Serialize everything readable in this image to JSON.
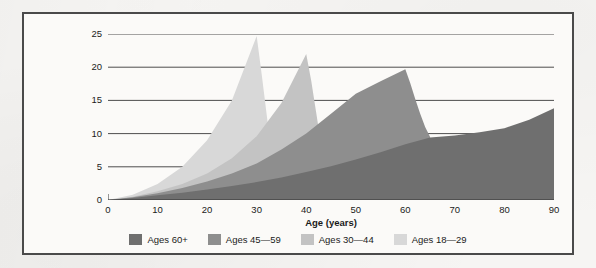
{
  "figure": {
    "frame_color": "#4a4a4a",
    "background_color": "#fbfaf8"
  },
  "chart_data": {
    "type": "area",
    "title": "",
    "subtitle": "",
    "xlabel": "Age (years)",
    "ylabel": "Lifetime prevalence of depression (%)",
    "ylabel_lines": [
      "Lifetime prevalence of",
      "depression (%)"
    ],
    "xlim": [
      0,
      90
    ],
    "ylim": [
      0,
      25
    ],
    "xticks": [
      0,
      10,
      20,
      30,
      40,
      50,
      60,
      70,
      80,
      90
    ],
    "yticks": [
      0,
      5,
      10,
      15,
      20,
      25
    ],
    "grid": "horizontal",
    "legend_position": "bottom",
    "overlap": "overlaid",
    "series": [
      {
        "name": "Ages 60+",
        "color": "#6f6f6f",
        "x": [
          0,
          5,
          10,
          15,
          20,
          25,
          30,
          35,
          40,
          45,
          50,
          55,
          60,
          65,
          70,
          75,
          80,
          85,
          90
        ],
        "values": [
          0,
          0.3,
          0.7,
          1.1,
          1.6,
          2.1,
          2.7,
          3.4,
          4.2,
          5.1,
          6.1,
          7.2,
          8.4,
          9.4,
          9.7,
          10.2,
          10.8,
          12.1,
          13.8
        ]
      },
      {
        "name": "Ages 45—59",
        "color": "#8e8e8e",
        "x": [
          0,
          5,
          10,
          15,
          20,
          25,
          30,
          35,
          40,
          45,
          50,
          55,
          60,
          61,
          62,
          63,
          64,
          65
        ],
        "values": [
          0,
          0.4,
          1.0,
          1.8,
          2.8,
          4.0,
          5.5,
          7.6,
          10.0,
          13.0,
          16.0,
          17.9,
          19.7,
          17.6,
          15.2,
          13.0,
          11.0,
          9.5
        ]
      },
      {
        "name": "Ages 30—44",
        "color": "#c3c3c3",
        "x": [
          0,
          5,
          10,
          15,
          20,
          25,
          30,
          35,
          40,
          41,
          42,
          43,
          44
        ],
        "values": [
          0,
          0.5,
          1.3,
          2.4,
          4.0,
          6.3,
          9.6,
          14.6,
          22.0,
          18.0,
          13.2,
          8.4,
          0
        ]
      },
      {
        "name": "Ages 18—29",
        "color": "#d8d8d8",
        "x": [
          0,
          5,
          10,
          15,
          20,
          25,
          30,
          31,
          32,
          33,
          34
        ],
        "values": [
          0,
          0.8,
          2.4,
          5.0,
          9.0,
          15.0,
          24.7,
          19.0,
          13.0,
          7.0,
          0
        ]
      }
    ]
  },
  "legend": {
    "items": [
      {
        "label": "Ages 60+",
        "color": "#6f6f6f"
      },
      {
        "label": "Ages 45—59",
        "color": "#8e8e8e"
      },
      {
        "label": "Ages 30—44",
        "color": "#c3c3c3"
      },
      {
        "label": "Ages 18—29",
        "color": "#d8d8d8"
      }
    ]
  }
}
